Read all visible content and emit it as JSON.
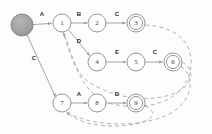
{
  "figure": {
    "type": "state-diagram",
    "background_color": "#fdfdfd",
    "node_stroke": "#8a8a8a",
    "node_fill": "#ffffff",
    "start_node_fill": "#9c9c9c",
    "edge_color": "#9a9a9a",
    "dashed_edge_color": "#a9a9a9",
    "label_color": "#2b2b2b"
  },
  "nodes": [
    {
      "id": "start",
      "label": "",
      "cx": 22,
      "cy": 25,
      "r": 11,
      "kind": "start-filled"
    },
    {
      "id": "n1",
      "label": "1",
      "cx": 62,
      "cy": 23,
      "r": 9,
      "kind": "normal"
    },
    {
      "id": "n2",
      "label": "2",
      "cx": 97,
      "cy": 23,
      "r": 9,
      "kind": "normal"
    },
    {
      "id": "n3",
      "label": "3",
      "cx": 136,
      "cy": 23,
      "r": 9,
      "kind": "accepting"
    },
    {
      "id": "n4",
      "label": "4",
      "cx": 97,
      "cy": 62,
      "r": 9,
      "kind": "normal"
    },
    {
      "id": "n5",
      "label": "5",
      "cx": 136,
      "cy": 62,
      "r": 9,
      "kind": "normal"
    },
    {
      "id": "n6",
      "label": "6",
      "cx": 173,
      "cy": 62,
      "r": 9,
      "kind": "accepting"
    },
    {
      "id": "n7",
      "label": "7",
      "cx": 62,
      "cy": 103,
      "r": 9,
      "kind": "normal"
    },
    {
      "id": "n8",
      "label": "8",
      "cx": 97,
      "cy": 103,
      "r": 9,
      "kind": "normal"
    },
    {
      "id": "n9",
      "label": "9",
      "cx": 136,
      "cy": 103,
      "r": 9,
      "kind": "accepting"
    }
  ],
  "edges": [
    {
      "from": "start",
      "to": "n1",
      "label": "A",
      "label_x": 42,
      "label_y": 14,
      "style": "solid"
    },
    {
      "from": "n1",
      "to": "n2",
      "label": "B",
      "label_x": 79,
      "label_y": 14,
      "style": "solid"
    },
    {
      "from": "n2",
      "to": "n3",
      "label": "C",
      "label_x": 117,
      "label_y": 14,
      "style": "solid"
    },
    {
      "from": "n1",
      "to": "n4",
      "label": "D",
      "label_x": 79,
      "label_y": 41,
      "style": "solid"
    },
    {
      "from": "n4",
      "to": "n5",
      "label": "E",
      "label_x": 117,
      "label_y": 52,
      "style": "solid"
    },
    {
      "from": "n5",
      "to": "n6",
      "label": "C",
      "label_x": 155,
      "label_y": 52,
      "style": "solid"
    },
    {
      "from": "start",
      "to": "n7",
      "label": "C",
      "label_x": 34,
      "label_y": 58,
      "style": "solid"
    },
    {
      "from": "n7",
      "to": "n8",
      "label": "A",
      "label_x": 79,
      "label_y": 94,
      "style": "solid"
    },
    {
      "from": "n8",
      "to": "n9",
      "label": "D",
      "label_x": 117,
      "label_y": 94,
      "style": "solid"
    }
  ],
  "back_edges": [
    {
      "from": "n3",
      "to": "n1",
      "style": "dashed",
      "description": "accepting-state-3-returns-to-state-1"
    },
    {
      "from": "n6",
      "to": "n1",
      "style": "dashed",
      "description": "accepting-state-6-returns-to-state-1"
    },
    {
      "from": "n9",
      "to": "n7",
      "style": "dashed",
      "description": "accepting-state-9-returns-to-state-7"
    },
    {
      "from": "n6",
      "to": "n7",
      "style": "dashed",
      "description": "accepting-state-6-returns-to-state-7"
    }
  ],
  "alphabet": [
    "A",
    "B",
    "C",
    "D",
    "E"
  ],
  "accepting_states": [
    "3",
    "6",
    "9"
  ]
}
